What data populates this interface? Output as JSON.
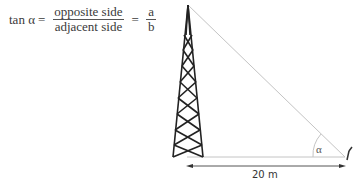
{
  "formula": {
    "lhs": "tan α",
    "equals": "=",
    "fraction1": {
      "numerator": "opposite side",
      "denominator": "adjacent side"
    },
    "fraction2": {
      "numerator": "a",
      "denominator": "b"
    }
  },
  "diagram": {
    "angle_label": "α",
    "distance_label": "20 m",
    "objects": [
      "tower",
      "hypotenuse-line",
      "base-line",
      "distance-arrow",
      "observer"
    ],
    "colors": {
      "tower": "#222222",
      "lines": "#bbbbbb",
      "arrow": "#555555"
    }
  }
}
